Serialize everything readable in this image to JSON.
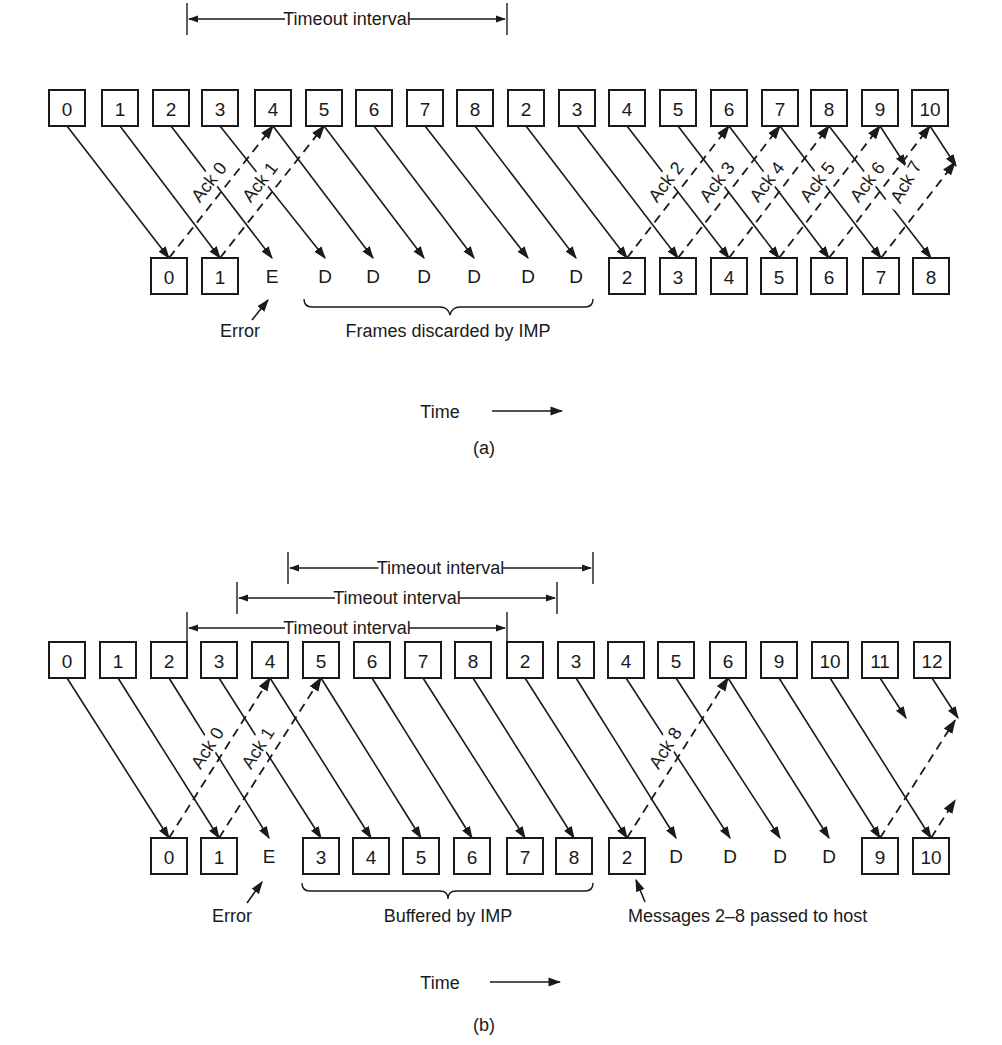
{
  "colors": {
    "ink": "#1a1a1a",
    "background": "#ffffff"
  },
  "panel_a": {
    "caption": "(a)",
    "time_label": "Time",
    "timeout": {
      "label": "Timeout interval",
      "x1": 187,
      "x2": 507,
      "y": 19
    },
    "top_y": 108,
    "bottom_y": 276,
    "sent": [
      {
        "x": 67,
        "label": "0"
      },
      {
        "x": 120,
        "label": "1"
      },
      {
        "x": 171,
        "label": "2"
      },
      {
        "x": 220,
        "label": "3"
      },
      {
        "x": 273,
        "label": "4"
      },
      {
        "x": 324,
        "label": "5"
      },
      {
        "x": 374,
        "label": "6"
      },
      {
        "x": 425,
        "label": "7"
      },
      {
        "x": 475,
        "label": "8"
      },
      {
        "x": 526,
        "label": "2"
      },
      {
        "x": 577,
        "label": "3"
      },
      {
        "x": 627,
        "label": "4"
      },
      {
        "x": 678,
        "label": "5"
      },
      {
        "x": 729,
        "label": "6"
      },
      {
        "x": 780,
        "label": "7"
      },
      {
        "x": 829,
        "label": "8"
      },
      {
        "x": 880,
        "label": "9"
      },
      {
        "x": 930,
        "label": "10"
      }
    ],
    "received": [
      {
        "x": 169,
        "label": "0",
        "boxed": true
      },
      {
        "x": 220,
        "label": "1",
        "boxed": true
      },
      {
        "x": 272,
        "label": "E",
        "boxed": false
      },
      {
        "x": 325,
        "label": "D",
        "boxed": false
      },
      {
        "x": 373,
        "label": "D",
        "boxed": false
      },
      {
        "x": 424,
        "label": "D",
        "boxed": false
      },
      {
        "x": 474,
        "label": "D",
        "boxed": false
      },
      {
        "x": 528,
        "label": "D",
        "boxed": false
      },
      {
        "x": 576,
        "label": "D",
        "boxed": false
      },
      {
        "x": 627,
        "label": "2",
        "boxed": true
      },
      {
        "x": 678,
        "label": "3",
        "boxed": true
      },
      {
        "x": 729,
        "label": "4",
        "boxed": true
      },
      {
        "x": 779,
        "label": "5",
        "boxed": true
      },
      {
        "x": 829,
        "label": "6",
        "boxed": true
      },
      {
        "x": 881,
        "label": "7",
        "boxed": true
      },
      {
        "x": 931,
        "label": "8",
        "boxed": true
      }
    ],
    "acks": [
      {
        "label": "Ack 0",
        "from": 169,
        "to": 273
      },
      {
        "label": "Ack 1",
        "from": 220,
        "to": 324
      },
      {
        "label": "Ack 2",
        "from": 627,
        "to": 729
      },
      {
        "label": "Ack 3",
        "from": 678,
        "to": 780
      },
      {
        "label": "Ack 4",
        "from": 729,
        "to": 829
      },
      {
        "label": "Ack 5",
        "from": 779,
        "to": 880
      },
      {
        "label": "Ack 6",
        "from": 829,
        "to": 930
      },
      {
        "label": "Ack 7",
        "from": 881,
        "to": 955
      }
    ],
    "annotations": {
      "error": "Error",
      "discarded": "Frames discarded by IMP"
    }
  },
  "panel_b": {
    "caption": "(b)",
    "time_label": "Time",
    "timeouts": [
      {
        "label": "Timeout interval",
        "x1": 288,
        "x2": 593,
        "y": 568
      },
      {
        "label": "Timeout interval",
        "x1": 237,
        "x2": 557,
        "y": 598
      },
      {
        "label": "Timeout interval",
        "x1": 187,
        "x2": 507,
        "y": 628
      }
    ],
    "top_y": 660,
    "bottom_y": 856,
    "sent": [
      {
        "x": 67,
        "label": "0"
      },
      {
        "x": 118,
        "label": "1"
      },
      {
        "x": 169,
        "label": "2"
      },
      {
        "x": 219,
        "label": "3"
      },
      {
        "x": 270,
        "label": "4"
      },
      {
        "x": 321,
        "label": "5"
      },
      {
        "x": 372,
        "label": "6"
      },
      {
        "x": 423,
        "label": "7"
      },
      {
        "x": 473,
        "label": "8"
      },
      {
        "x": 525,
        "label": "2"
      },
      {
        "x": 576,
        "label": "3"
      },
      {
        "x": 626,
        "label": "4"
      },
      {
        "x": 676,
        "label": "5"
      },
      {
        "x": 728,
        "label": "6"
      },
      {
        "x": 779,
        "label": "9"
      },
      {
        "x": 830,
        "label": "10"
      },
      {
        "x": 880,
        "label": "11"
      },
      {
        "x": 932,
        "label": "12"
      }
    ],
    "received": [
      {
        "x": 169,
        "label": "0",
        "boxed": true
      },
      {
        "x": 219,
        "label": "1",
        "boxed": true
      },
      {
        "x": 269,
        "label": "E",
        "boxed": false
      },
      {
        "x": 321,
        "label": "3",
        "boxed": true
      },
      {
        "x": 371,
        "label": "4",
        "boxed": true
      },
      {
        "x": 421,
        "label": "5",
        "boxed": true
      },
      {
        "x": 472,
        "label": "6",
        "boxed": true
      },
      {
        "x": 525,
        "label": "7",
        "boxed": true
      },
      {
        "x": 574,
        "label": "8",
        "boxed": true
      },
      {
        "x": 627,
        "label": "2",
        "boxed": true
      },
      {
        "x": 676,
        "label": "D",
        "boxed": false
      },
      {
        "x": 730,
        "label": "D",
        "boxed": false
      },
      {
        "x": 780,
        "label": "D",
        "boxed": false
      },
      {
        "x": 829,
        "label": "D",
        "boxed": false
      },
      {
        "x": 880,
        "label": "9",
        "boxed": true
      },
      {
        "x": 931,
        "label": "10",
        "boxed": true
      }
    ],
    "acks": [
      {
        "label": "Ack 0",
        "from": 169,
        "to": 270
      },
      {
        "label": "Ack 1",
        "from": 219,
        "to": 321
      },
      {
        "label": "Ack 8",
        "from": 627,
        "to": 728
      },
      {
        "label": "",
        "from": 880,
        "to": 955
      },
      {
        "label": "",
        "from": 931,
        "to": 955
      }
    ],
    "annotations": {
      "error": "Error",
      "buffered": "Buffered by IMP",
      "passed": "Messages 2–8 passed to host"
    }
  }
}
